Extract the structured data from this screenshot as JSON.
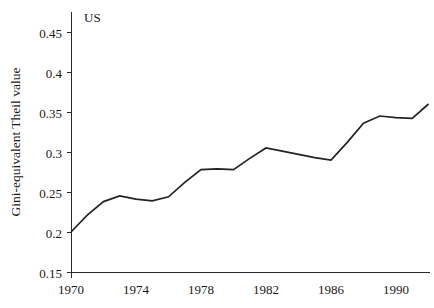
{
  "chart_data": {
    "type": "line",
    "title": "",
    "xlabel": "",
    "ylabel": "Gini-equivalent Theil value",
    "annotation": "US",
    "legend_position": "inside-top-left",
    "grid": false,
    "xlim": [
      1970,
      1992
    ],
    "ylim": [
      0.15,
      0.475
    ],
    "xticks": [
      1970,
      1974,
      1978,
      1982,
      1986,
      1990
    ],
    "xtick_labels": [
      "1970",
      "1974",
      "1978",
      "1982",
      "1986",
      "1990"
    ],
    "yticks": [
      0.15,
      0.2,
      0.25,
      0.3,
      0.35,
      0.4,
      0.45
    ],
    "ytick_labels": [
      "0.15",
      "0.2",
      "0.25",
      "0.3",
      "0.35",
      "0.4",
      "0.45"
    ],
    "series": [
      {
        "name": "US",
        "x": [
          1970,
          1971,
          1972,
          1973,
          1974,
          1975,
          1976,
          1977,
          1978,
          1979,
          1980,
          1981,
          1982,
          1983,
          1984,
          1985,
          1986,
          1987,
          1988,
          1989,
          1990,
          1991,
          1992
        ],
        "values": [
          0.2,
          0.221,
          0.238,
          0.245,
          0.241,
          0.239,
          0.244,
          0.262,
          0.278,
          0.279,
          0.278,
          0.292,
          0.305,
          0.301,
          0.297,
          0.293,
          0.29,
          0.312,
          0.336,
          0.345,
          0.343,
          0.342,
          0.36
        ]
      }
    ]
  },
  "axes": {
    "ylabel": "Gini-equivalent Theil value"
  },
  "annotations": {
    "series_label": "US"
  }
}
